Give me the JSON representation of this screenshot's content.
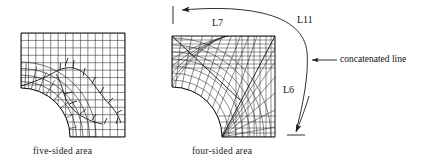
{
  "figure": {
    "type": "finite-element-mesh-diagram",
    "background_color": "#ffffff",
    "line_color": "#1a1a1a",
    "panels": [
      {
        "id": "left-panel",
        "caption": "five-sided area",
        "mesh_type": "free-paved-mesh",
        "outline": "square with quarter-circle notch removed at lower-left corner",
        "notch_corner": "bottom-left",
        "grid_divisions": 14
      },
      {
        "id": "right-panel",
        "caption": "four-sided area",
        "mesh_type": "mapped-structured-mesh",
        "outline": "square with quarter-circle notch removed at lower-left corner",
        "notch_corner": "bottom-left",
        "grid_divisions": 16,
        "diagonal_seam": true
      }
    ],
    "labels": [
      {
        "id": "l7",
        "text": "L7"
      },
      {
        "id": "l11",
        "text": "L11"
      },
      {
        "id": "l6",
        "text": "L6"
      }
    ],
    "annotations": [
      {
        "id": "concatenated-line",
        "text": "concatenated line"
      }
    ],
    "arrows": [
      {
        "id": "sweep-arrow",
        "description": "curved double-ended arrow sweeping from bottom tick up and over to left tick",
        "head_ends": [
          "left-top",
          "bottom"
        ]
      },
      {
        "id": "callout-arrow",
        "description": "horizontal leader arrow pointing left at the concatenated line"
      }
    ]
  }
}
